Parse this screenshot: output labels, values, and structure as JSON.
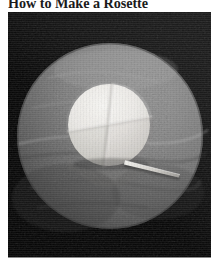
{
  "page": {
    "background_color": "#ffffff",
    "width": 221,
    "height": 263
  },
  "article": {
    "title": "How to Make a Rosette"
  },
  "photo": {
    "alt_label": "rosette-construction-photograph",
    "background_color": "#050505",
    "frame": {
      "x": 8,
      "y": 12,
      "width": 203,
      "height": 246
    },
    "colorspace": "grayscale",
    "subjects": [
      {
        "name": "fabric-disc",
        "shape": "circle",
        "center_x": 102,
        "center_y": 124,
        "radius": 93,
        "fill_color": "#8a8a8a",
        "shadow_color": "#4a4a4a",
        "highlight_color": "#a6a6a6",
        "description": "large gray fabric circle laid flat on black surface"
      },
      {
        "name": "inner-folded-disc",
        "shape": "circle",
        "center_x": 101,
        "center_y": 113,
        "radius": 41,
        "fill_color": "#e4e2dd",
        "highlight_color": "#f6f5f2",
        "shadow_color": "#bdbbb6",
        "description": "smaller pale circle creased into quadrants by two crossing fold lines"
      },
      {
        "name": "crease-line-vertical",
        "shape": "line",
        "x1": 104,
        "y1": 73,
        "x2": 96,
        "y2": 153,
        "color": "#b4b2ad"
      },
      {
        "name": "crease-line-horizontal",
        "shape": "line",
        "x1": 61,
        "y1": 120,
        "x2": 142,
        "y2": 106,
        "color": "#b4b2ad"
      },
      {
        "name": "needle-pin",
        "shape": "sliver",
        "x1": 117,
        "y1": 150,
        "x2": 172,
        "y2": 165,
        "color": "#d8d6d1",
        "description": "thin pointed needle resting on the fabric, angled toward lower right"
      }
    ]
  }
}
